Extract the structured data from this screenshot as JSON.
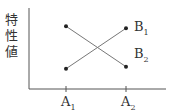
{
  "chart_data": {
    "type": "line",
    "title": "",
    "xlabel": "",
    "ylabel": "特性値",
    "categories": [
      "A1",
      "A2"
    ],
    "category_labels": [
      {
        "base": "A",
        "sub": "1"
      },
      {
        "base": "A",
        "sub": "2"
      }
    ],
    "series": [
      {
        "name": "B1",
        "label": {
          "base": "B",
          "sub": "1"
        },
        "values": [
          1.0,
          3.0
        ]
      },
      {
        "name": "B2",
        "label": {
          "base": "B",
          "sub": "2"
        },
        "values": [
          3.1,
          1.1
        ]
      }
    ],
    "ylim": [
      0,
      4
    ],
    "grid": false,
    "legend": "inline-right",
    "colors": {
      "line": "#777777",
      "point": "#222222",
      "axis": "#555555"
    }
  },
  "ylabel_chars": [
    "特",
    "性",
    "値"
  ]
}
